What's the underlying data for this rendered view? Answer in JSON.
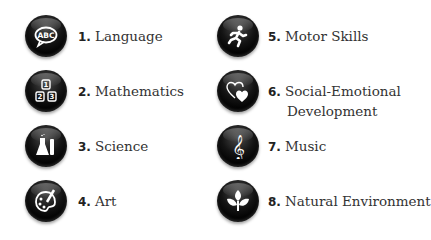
{
  "items": [
    {
      "number": "1.",
      "label": "Language",
      "icon": "speech-bubble-abc-icon"
    },
    {
      "number": "2.",
      "label": "Mathematics",
      "icon": "number-blocks-icon"
    },
    {
      "number": "3.",
      "label": "Science",
      "icon": "flask-test-tube-icon"
    },
    {
      "number": "4.",
      "label": "Art",
      "icon": "paint-palette-icon"
    },
    {
      "number": "5.",
      "label": "Motor Skills",
      "icon": "running-figure-icon"
    },
    {
      "number": "6.",
      "label": "Social-Emotional",
      "label_line2": "Development",
      "icon": "two-hearts-icon"
    },
    {
      "number": "7.",
      "label": "Music",
      "icon": "treble-clef-icon"
    },
    {
      "number": "8.",
      "label": "Natural Environment",
      "icon": "leaves-plant-icon"
    }
  ],
  "icon_text": {
    "abc": "ABC",
    "one": "1",
    "two": "2",
    "three": "3",
    "clef": "𝄞"
  },
  "colors": {
    "icon_bg": "#000000",
    "icon_glyph": "#ffffff",
    "text": "#333333",
    "background": "#ffffff"
  }
}
